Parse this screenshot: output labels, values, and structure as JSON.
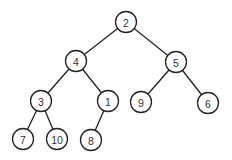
{
  "diagram": {
    "type": "binary-tree",
    "colors": {
      "stroke": "#222222",
      "fill": "#ffffff",
      "text": "#333333"
    },
    "node_radius": 10.5,
    "nodes": [
      {
        "id": "n2",
        "label": "2",
        "x": 126,
        "y": 22
      },
      {
        "id": "n4",
        "label": "4",
        "x": 76,
        "y": 61
      },
      {
        "id": "n5",
        "label": "5",
        "x": 176,
        "y": 62
      },
      {
        "id": "n3",
        "label": "3",
        "x": 41,
        "y": 101
      },
      {
        "id": "n1",
        "label": "1",
        "x": 108,
        "y": 101
      },
      {
        "id": "n9",
        "label": "9",
        "x": 141,
        "y": 102
      },
      {
        "id": "n6",
        "label": "6",
        "x": 208,
        "y": 103
      },
      {
        "id": "n7",
        "label": "7",
        "x": 23,
        "y": 139
      },
      {
        "id": "n10",
        "label": "10",
        "x": 57,
        "y": 139
      },
      {
        "id": "n8",
        "label": "8",
        "x": 91,
        "y": 140
      }
    ],
    "edges": [
      {
        "from": "n2",
        "to": "n4"
      },
      {
        "from": "n2",
        "to": "n5"
      },
      {
        "from": "n4",
        "to": "n3"
      },
      {
        "from": "n4",
        "to": "n1"
      },
      {
        "from": "n5",
        "to": "n9"
      },
      {
        "from": "n5",
        "to": "n6"
      },
      {
        "from": "n3",
        "to": "n7"
      },
      {
        "from": "n3",
        "to": "n10"
      },
      {
        "from": "n1",
        "to": "n8"
      }
    ]
  }
}
